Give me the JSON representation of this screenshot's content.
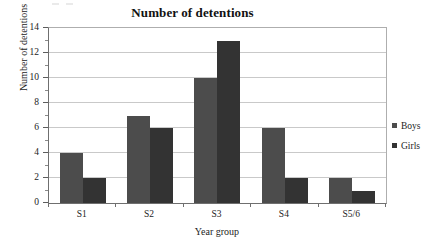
{
  "chart_data": {
    "type": "bar",
    "title": "Number of detentions",
    "xlabel": "Year group",
    "ylabel": "Number of detentions",
    "categories": [
      "S1",
      "S2",
      "S3",
      "S4",
      "S5/6"
    ],
    "series": [
      {
        "name": "Boys",
        "color": "#4c4c4c",
        "values": [
          4,
          7,
          10,
          6,
          2
        ]
      },
      {
        "name": "Girls",
        "color": "#333333",
        "values": [
          2,
          6,
          13,
          2,
          1
        ]
      }
    ],
    "ylim": [
      0,
      14
    ],
    "y_major_ticks": [
      0,
      2,
      4,
      6,
      8,
      10,
      12,
      14
    ],
    "y_minor_ticks": [
      1,
      3,
      5,
      7,
      9,
      11,
      13
    ],
    "y_tick_labels": [
      "0",
      "2",
      "4",
      "6",
      "8",
      "10",
      "12",
      "14"
    ],
    "grid": true,
    "grid_axis": "y",
    "grid_color": "#c9c9c9",
    "legend_position": "right",
    "plot_background": "#ffffff",
    "axis_color": "#6f6f6f"
  },
  "legend": {
    "items": [
      {
        "label": "Boys"
      },
      {
        "label": "Girls"
      }
    ]
  }
}
